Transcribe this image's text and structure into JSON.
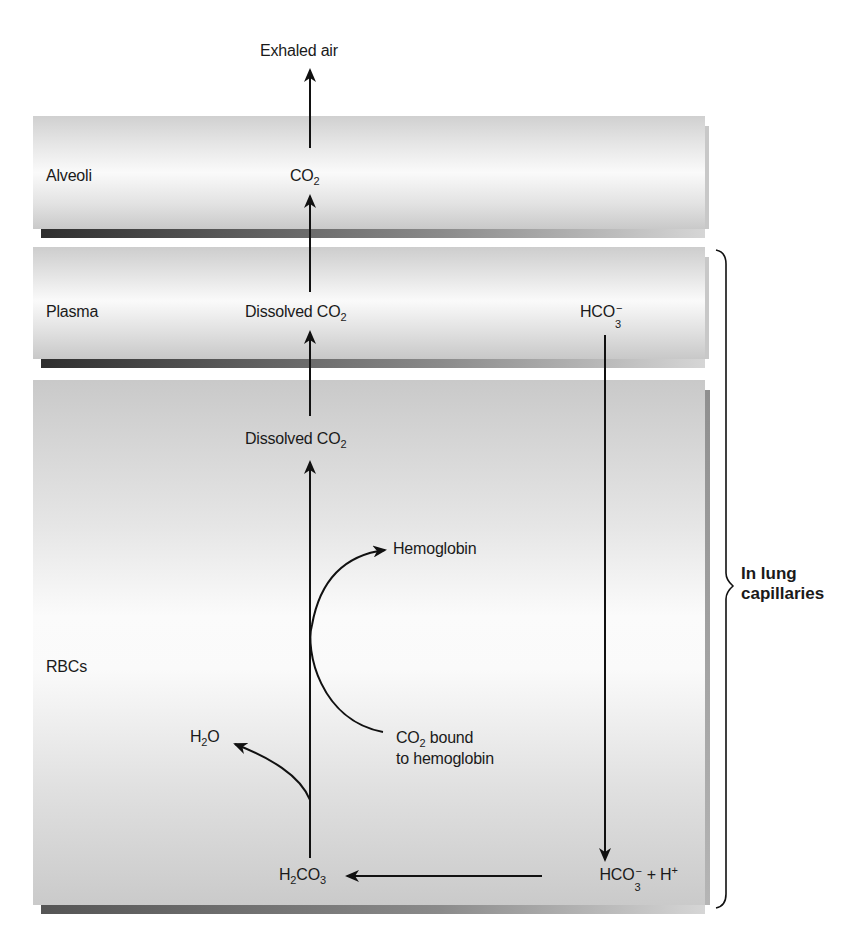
{
  "diagram": {
    "title_top": "Exhaled air",
    "compartments": [
      {
        "id": "alveoli",
        "label": "Alveoli"
      },
      {
        "id": "plasma",
        "label": "Plasma"
      },
      {
        "id": "rbcs",
        "label": "RBCs"
      }
    ],
    "species": {
      "alveoli_co2": {
        "base": "CO",
        "sub": "2"
      },
      "plasma_dissolved_co2": {
        "text": "Dissolved CO",
        "sub": "2"
      },
      "plasma_hco3": {
        "base": "HCO",
        "sub": "3",
        "sup": "−"
      },
      "rbc_dissolved_co2": {
        "text": "Dissolved CO",
        "sub": "2"
      },
      "hemoglobin": "Hemoglobin",
      "co2_bound_line1_base": "CO",
      "co2_bound_line1_sub": "2",
      "co2_bound_line1_rest": " bound",
      "co2_bound_line2": "to hemoglobin",
      "water": {
        "h": "H",
        "sub": "2",
        "rest": "O"
      },
      "carbonic_acid": {
        "h": "H",
        "sub1": "2",
        "mid": "CO",
        "sub2": "3"
      },
      "bicarb_plus_h": {
        "base": "HCO",
        "sub": "3",
        "sup": "−",
        "rest": " + H",
        "sup2": "+"
      }
    },
    "bracket_label_line1": "In lung",
    "bracket_label_line2": "capillaries",
    "colors": {
      "arrow": "#111111",
      "band_light": "#f4f4f4",
      "band_mid": "#cfcfcf",
      "shadow": "#3a3a3a"
    }
  }
}
